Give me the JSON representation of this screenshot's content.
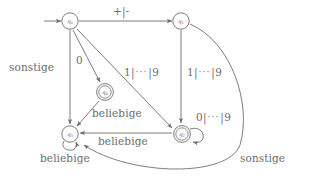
{
  "diagram": {
    "kind": "finite-state-automaton",
    "title": "",
    "colors": {
      "stroke": "#6e6e6e",
      "text": "#6d6d6d",
      "background": "#ffffff"
    },
    "states": [
      {
        "id": "q0",
        "name": "q",
        "subscript": "0",
        "accepting": false,
        "start": true,
        "x": 70,
        "y": 21
      },
      {
        "id": "q1",
        "name": "q",
        "subscript": "1",
        "accepting": false,
        "start": false,
        "x": 181,
        "y": 21
      },
      {
        "id": "q4",
        "name": "q",
        "subscript": "4",
        "accepting": true,
        "start": false,
        "x": 105,
        "y": 92
      },
      {
        "id": "q3",
        "name": "q",
        "subscript": "3",
        "accepting": false,
        "start": false,
        "x": 70,
        "y": 134
      },
      {
        "id": "q2",
        "name": "q",
        "subscript": "2",
        "accepting": true,
        "start": false,
        "x": 182,
        "y": 134
      }
    ],
    "edges": [
      {
        "id": "start-arrow",
        "from": "",
        "to": "q0",
        "label": ""
      },
      {
        "id": "q0-q1",
        "from": "q0",
        "to": "q1",
        "label": "+|-"
      },
      {
        "id": "q0-q3",
        "from": "q0",
        "to": "q3",
        "label": "sonstige"
      },
      {
        "id": "q0-q4",
        "from": "q0",
        "to": "q4",
        "label": "0"
      },
      {
        "id": "q0-q2",
        "from": "q0",
        "to": "q2",
        "label": "1|···|9"
      },
      {
        "id": "q1-q2",
        "from": "q1",
        "to": "q2",
        "label": "1|···|9"
      },
      {
        "id": "q1-q3",
        "from": "q1",
        "to": "q3",
        "label": "sonstige"
      },
      {
        "id": "q2-q2",
        "from": "q2",
        "to": "q2",
        "label": "0|···|9"
      },
      {
        "id": "q2-q3",
        "from": "q2",
        "to": "q3",
        "label": "beliebige"
      },
      {
        "id": "q4-q3",
        "from": "q4",
        "to": "q3",
        "label": "beliebige"
      },
      {
        "id": "q3-q3",
        "from": "q3",
        "to": "q3",
        "label": "beliebige"
      }
    ],
    "labels": {
      "plus_minus": "+|-",
      "zero": "0",
      "sonstige_left": "sonstige",
      "sonstige_right": "sonstige",
      "one_to_nine_a": {
        "first": "1",
        "bar1": "|",
        "dots": "···",
        "bar2": "|",
        "last": "9"
      },
      "one_to_nine_b": {
        "first": "1",
        "bar1": "|",
        "dots": "···",
        "bar2": "|",
        "last": "9"
      },
      "zero_to_nine": {
        "first": "0",
        "bar1": "|",
        "dots": "···",
        "bar2": "|",
        "last": "9"
      },
      "beliebige_q4": "beliebige",
      "beliebige_q2": "beliebige",
      "beliebige_q3": "beliebige"
    },
    "state_labels": {
      "q0": {
        "name": "q",
        "sub": "0"
      },
      "q1": {
        "name": "q",
        "sub": "1"
      },
      "q2": {
        "name": "q",
        "sub": "2"
      },
      "q3": {
        "name": "q",
        "sub": "3"
      },
      "q4": {
        "name": "q",
        "sub": "4"
      }
    }
  }
}
